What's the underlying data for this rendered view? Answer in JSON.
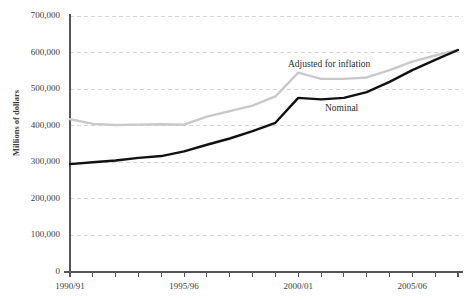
{
  "chart_title": "",
  "chart_data": {
    "type": "line",
    "title": "",
    "xlabel": "",
    "ylabel": "Millions of dollars",
    "ylim": [
      0,
      700000
    ],
    "yticks": [
      0,
      100000,
      200000,
      300000,
      400000,
      500000,
      600000,
      700000
    ],
    "ytick_labels": [
      "0",
      "100,000",
      "200,000",
      "300,000",
      "400,000",
      "500,000",
      "600,000",
      "700,000"
    ],
    "grid": true,
    "grid_style": "dashed",
    "grid_color": "#d5d5d5",
    "legend_position": "inline-annotations",
    "x": [
      "1990/91",
      "1991/92",
      "1992/93",
      "1993/94",
      "1994/95",
      "1995/96",
      "1996/97",
      "1997/98",
      "1998/99",
      "1999/00",
      "2000/01",
      "2001/02",
      "2002/03",
      "2003/04",
      "2004/05",
      "2005/06",
      "2006/07",
      "2007/08"
    ],
    "xtick_labels": [
      "1990/91",
      "1995/96",
      "2000/01",
      "2005/06"
    ],
    "xtick_label_indices": [
      0,
      5,
      10,
      15
    ],
    "series": [
      {
        "name": "Adjusted for inflation",
        "color": "#c9c9c9",
        "values": [
          418000,
          405000,
          402000,
          403000,
          404000,
          403000,
          425000,
          440000,
          455000,
          480000,
          545000,
          528000,
          528000,
          532000,
          552000,
          575000,
          592000,
          607000
        ]
      },
      {
        "name": "Nominal",
        "color": "#111111",
        "values": [
          295000,
          300000,
          305000,
          312000,
          317000,
          330000,
          348000,
          365000,
          385000,
          408000,
          476000,
          472000,
          476000,
          492000,
          520000,
          552000,
          580000,
          607000
        ]
      }
    ]
  }
}
